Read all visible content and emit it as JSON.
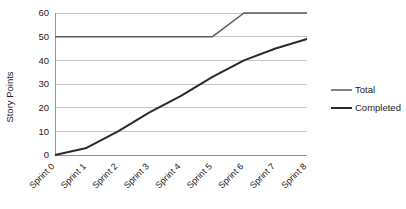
{
  "chart_data": {
    "type": "line",
    "title": "",
    "subtitle": "",
    "xlabel": "",
    "ylabel": "Story Points",
    "categories": [
      "Sprint 0",
      "Sprint 1",
      "Sprint 2",
      "Sprint 3",
      "Sprint 4",
      "Sprint 5",
      "Sprint 6",
      "Sprint 7",
      "Sprint 8"
    ],
    "ylim": [
      0,
      60
    ],
    "yticks": [
      0,
      10,
      20,
      30,
      40,
      50,
      60
    ],
    "ytick_labels": [
      "0",
      "10",
      "20",
      "30",
      "40",
      "50",
      "60"
    ],
    "grid": true,
    "grid_axis": "y",
    "legend_position": "right",
    "series": [
      {
        "name": "Total",
        "color": "#5a5a5a",
        "width": 1.5,
        "values": [
          50,
          50,
          50,
          50,
          50,
          50,
          60,
          60,
          60
        ]
      },
      {
        "name": "Completed",
        "color": "#2b2b2b",
        "width": 2.0,
        "values": [
          0,
          3,
          10,
          18,
          25,
          33,
          40,
          45,
          49
        ]
      }
    ]
  },
  "legend": {
    "items": [
      {
        "label": "Total",
        "color": "#5a5a5a",
        "width": 1.5
      },
      {
        "label": "Completed",
        "color": "#2b2b2b",
        "width": 2.0
      }
    ]
  },
  "axes": {
    "y_title": "Story Points"
  },
  "colors": {
    "background": "#ffffff",
    "grid": "#b5b5b5",
    "axis": "#8a8a8a",
    "text": "#222222",
    "total": "#5a5a5a",
    "completed": "#2b2b2b"
  }
}
